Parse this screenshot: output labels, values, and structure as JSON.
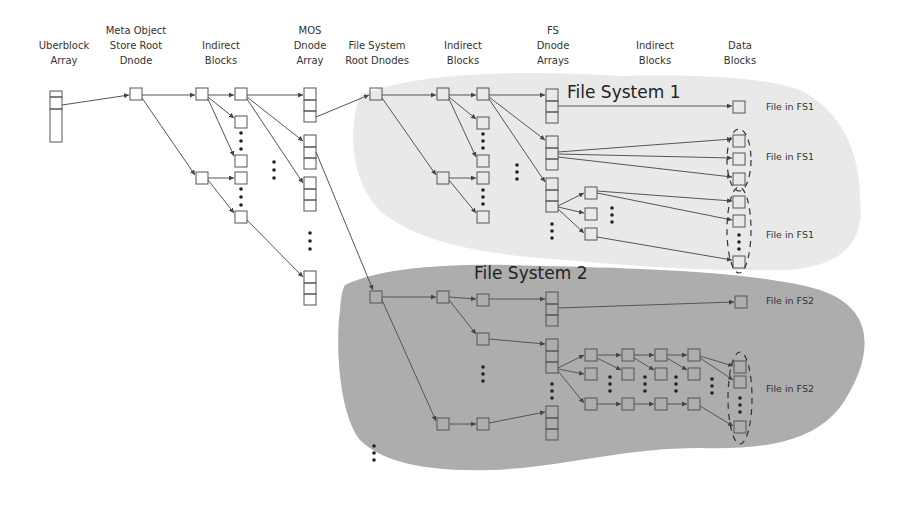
{
  "column_headers": [
    {
      "text": "Uberblock\nArray",
      "x": 64,
      "y": 40
    },
    {
      "text": "Meta Object\nStore Root\nDnode",
      "x": 136,
      "y": 25
    },
    {
      "text": "Indirect\nBlocks",
      "x": 221,
      "y": 40
    },
    {
      "text": "MOS\nDnode\nArray",
      "x": 310,
      "y": 25
    },
    {
      "text": "File System\nRoot Dnodes",
      "x": 377,
      "y": 40
    },
    {
      "text": "Indirect\nBlocks",
      "x": 463,
      "y": 40
    },
    {
      "text": "FS\nDnode\nArrays",
      "x": 553,
      "y": 25
    },
    {
      "text": "Indirect\nBlocks",
      "x": 655,
      "y": 40
    },
    {
      "text": "Data\nBlocks",
      "x": 740,
      "y": 40
    }
  ],
  "regions": [
    {
      "name": "File System 1",
      "color": "#e9e9e9",
      "title_x": 567,
      "title_y": 84
    },
    {
      "name": "File System 2",
      "color": "#adadad",
      "title_x": 474,
      "title_y": 264
    }
  ],
  "file_labels": [
    {
      "text": "File in FS1",
      "x": 766,
      "y": 127
    },
    {
      "text": "File in FS1",
      "x": 766,
      "y": 152
    },
    {
      "text": "File in FS1",
      "x": 766,
      "y": 230
    },
    {
      "text": "File in FS2",
      "x": 766,
      "y": 295
    },
    {
      "text": "File in FS2",
      "x": 766,
      "y": 384
    }
  ],
  "colors": {
    "stroke": "#555555",
    "fs1_region": "#e9e9e9",
    "fs2_region": "#adadad",
    "background": "#ffffff"
  }
}
